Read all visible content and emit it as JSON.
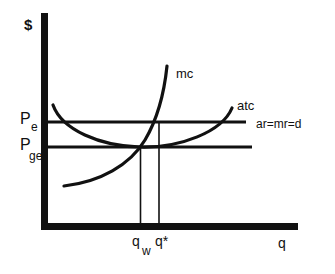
{
  "diagram": {
    "axes": {
      "y_label": "$",
      "x_label": "q"
    },
    "curves": {
      "mc_label": "mc",
      "atc_label": "atc",
      "demand_label": "ar=mr=d"
    },
    "price_levels": {
      "pe_main": "P",
      "pe_sub": "e",
      "pge_main": "P",
      "pge_sub": "ge"
    },
    "quantities": {
      "qw_main": "q",
      "qw_sub": "w",
      "qstar": "q*"
    },
    "colors": {
      "ink": "#111111",
      "background": "#ffffff"
    }
  }
}
